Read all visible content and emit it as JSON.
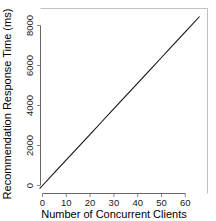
{
  "chart_data": {
    "type": "line",
    "title": "",
    "subtitle": "",
    "xlabel": "Number of Concurrent Clients",
    "ylabel": "Recommendation Response Time (ms)",
    "xlim": [
      -1.6,
      67.5
    ],
    "ylim": [
      -330,
      8700
    ],
    "grid": false,
    "legend": null,
    "legend_position": "none",
    "xticks": [
      0,
      10,
      20,
      30,
      40,
      50,
      60
    ],
    "xtick_labels": [
      "0",
      "10",
      "20",
      "30",
      "40",
      "50",
      "60"
    ],
    "yticks": [
      0,
      2000,
      4000,
      6000,
      8000
    ],
    "ytick_labels": [
      "0",
      "2000",
      "4000",
      "6000",
      "8000"
    ],
    "series": [
      {
        "name": "Recommendation response time",
        "color": "#111111",
        "x": [
          0,
          5,
          10,
          15,
          20,
          25,
          30,
          35,
          40,
          45,
          50,
          55,
          60,
          66
        ],
        "values": [
          0,
          640,
          1280,
          1920,
          2560,
          3200,
          3840,
          4480,
          5120,
          5760,
          6400,
          7040,
          7680,
          8450
        ]
      }
    ],
    "annotations": []
  },
  "axes": {
    "x_title": "Number of Concurrent Clients",
    "y_title": "Recommendation Response Time (ms)"
  }
}
